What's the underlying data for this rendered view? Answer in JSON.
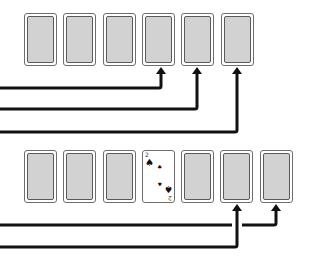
{
  "diagram": {
    "top_row": {
      "cards": [
        {
          "state": "face-down"
        },
        {
          "state": "face-down"
        },
        {
          "state": "face-down"
        },
        {
          "state": "face-down"
        },
        {
          "state": "face-down"
        },
        {
          "state": "face-down"
        }
      ],
      "arrows_to_card_index": [
        3,
        4,
        5
      ]
    },
    "bottom_row": {
      "cards": [
        {
          "state": "face-down"
        },
        {
          "state": "face-down"
        },
        {
          "state": "face-down"
        },
        {
          "state": "face-up",
          "rank": "2",
          "suit": "spades",
          "suit_glyph": "♠"
        },
        {
          "state": "face-down"
        },
        {
          "state": "face-down"
        },
        {
          "state": "face-down"
        }
      ],
      "arrows_to_card_index": [
        5,
        6
      ]
    },
    "colors": {
      "card_back": "#d2d2d2",
      "card_border": "#6e6e6e",
      "arrow": "#111111",
      "background": "#ffffff"
    }
  }
}
